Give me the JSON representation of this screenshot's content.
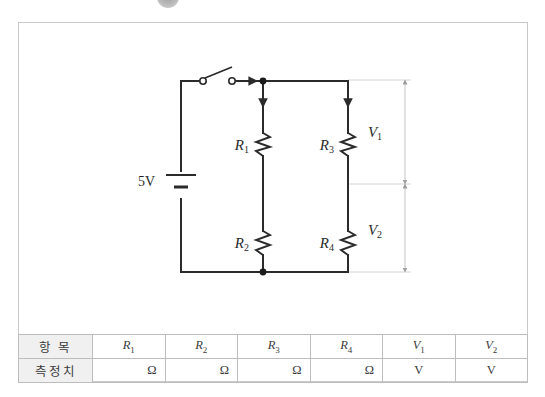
{
  "badge": {
    "name": "section-badge"
  },
  "circuit": {
    "source_label": "5V",
    "components": [
      {
        "id": "R1",
        "label": "R",
        "sub": "1"
      },
      {
        "id": "R2",
        "label": "R",
        "sub": "2"
      },
      {
        "id": "R3",
        "label": "R",
        "sub": "3"
      },
      {
        "id": "R4",
        "label": "R",
        "sub": "4"
      }
    ],
    "dimensions": [
      {
        "id": "V1",
        "label": "V",
        "sub": "1"
      },
      {
        "id": "V2",
        "label": "V",
        "sub": "2"
      }
    ],
    "switch": {
      "state": "open"
    },
    "colors": {
      "wire": "#2b2b2b",
      "dimension": "#c4c4c4",
      "label": "#2b2b2b"
    }
  },
  "table": {
    "rows": [
      {
        "head": "항 목",
        "cells": [
          {
            "text": "R",
            "sub": "1",
            "kind": "symbol"
          },
          {
            "text": "R",
            "sub": "2",
            "kind": "symbol"
          },
          {
            "text": "R",
            "sub": "3",
            "kind": "symbol"
          },
          {
            "text": "R",
            "sub": "4",
            "kind": "symbol"
          },
          {
            "text": "V",
            "sub": "1",
            "kind": "symbol"
          },
          {
            "text": "V",
            "sub": "2",
            "kind": "symbol"
          }
        ]
      },
      {
        "head": "측정치",
        "cells": [
          {
            "text": "Ω",
            "kind": "unit"
          },
          {
            "text": "Ω",
            "kind": "unit"
          },
          {
            "text": "Ω",
            "kind": "unit"
          },
          {
            "text": "Ω",
            "kind": "unit"
          },
          {
            "text": "V",
            "kind": "unit"
          },
          {
            "text": "V",
            "kind": "unit"
          }
        ]
      }
    ],
    "head_labels": {
      "row1": "항 목",
      "row2": "측정치"
    },
    "symbols": {
      "r1": "R",
      "r2": "R",
      "r3": "R",
      "r4": "R",
      "v1": "V",
      "v2": "V",
      "sub1": "1",
      "sub2": "2",
      "sub3": "3",
      "sub4": "4"
    },
    "units": {
      "ohm": "Ω",
      "volt": "V"
    }
  }
}
